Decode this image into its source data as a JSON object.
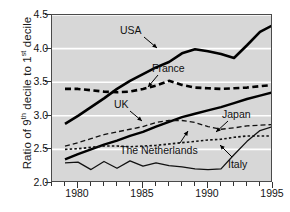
{
  "chart_data": {
    "type": "line",
    "title": "",
    "xlabel": "",
    "ylabel": "Ratio of 9th decile to 1st decile",
    "ylabel_parts": {
      "pre": "Ratio of 9",
      "sup1": "th",
      "mid": " decile to 1",
      "sup2": "st",
      "post": " decile"
    },
    "xlim": [
      1978,
      1995
    ],
    "ylim": [
      2.0,
      4.5
    ],
    "yticks": [
      2.0,
      2.5,
      3.0,
      3.5,
      4.0,
      4.5
    ],
    "ytick_labels": [
      "2.0",
      "2.5",
      "3.0",
      "3.5",
      "4.0",
      "4.5"
    ],
    "xticks": [
      1980,
      1985,
      1990,
      1995
    ],
    "xtick_labels": [
      "1980",
      "1985",
      "1990",
      "1995"
    ],
    "x_minor_ticks": [
      1978,
      1979,
      1980,
      1981,
      1982,
      1983,
      1984,
      1985,
      1986,
      1987,
      1988,
      1989,
      1990,
      1991,
      1992,
      1993,
      1994,
      1995
    ],
    "grid": "horizontal-white",
    "grid_color": "#ffffff",
    "plot_background": "#d7d7d7",
    "legend": "inline-annotations",
    "series": [
      {
        "name": "USA",
        "style": "thick-solid",
        "color": "#000000",
        "width": 2.6,
        "dash": "",
        "x": [
          1979,
          1980,
          1981,
          1982,
          1983,
          1984,
          1985,
          1986,
          1987,
          1988,
          1989,
          1990,
          1991,
          1992,
          1993,
          1994,
          1995
        ],
        "values": [
          2.88,
          3.0,
          3.13,
          3.26,
          3.4,
          3.52,
          3.62,
          3.72,
          3.8,
          3.93,
          3.99,
          3.96,
          3.92,
          3.86,
          4.05,
          4.25,
          4.35
        ]
      },
      {
        "name": "France",
        "style": "thick-dashed",
        "color": "#000000",
        "width": 2.6,
        "dash": "6,3.5",
        "x": [
          1979,
          1980,
          1981,
          1982,
          1983,
          1984,
          1985,
          1986,
          1987,
          1988,
          1989,
          1990,
          1991,
          1992,
          1993,
          1994,
          1995
        ],
        "values": [
          3.4,
          3.4,
          3.38,
          3.36,
          3.35,
          3.36,
          3.4,
          3.45,
          3.52,
          3.46,
          3.42,
          3.41,
          3.4,
          3.41,
          3.42,
          3.44,
          3.46
        ]
      },
      {
        "name": "UK",
        "style": "thick-solid",
        "color": "#000000",
        "width": 2.4,
        "dash": "",
        "x": [
          1979,
          1980,
          1981,
          1982,
          1983,
          1984,
          1985,
          1986,
          1987,
          1988,
          1989,
          1990,
          1991,
          1992,
          1993,
          1994,
          1995
        ],
        "values": [
          2.35,
          2.43,
          2.5,
          2.57,
          2.63,
          2.7,
          2.76,
          2.84,
          2.91,
          2.98,
          3.03,
          3.08,
          3.13,
          3.19,
          3.25,
          3.3,
          3.35
        ]
      },
      {
        "name": "Japan",
        "style": "thin-dashed",
        "color": "#111111",
        "width": 1.3,
        "dash": "5,3",
        "x": [
          1979,
          1980,
          1981,
          1982,
          1983,
          1984,
          1985,
          1986,
          1987,
          1988,
          1989,
          1990,
          1991,
          1992,
          1993,
          1994,
          1995
        ],
        "values": [
          2.55,
          2.6,
          2.66,
          2.72,
          2.76,
          2.8,
          2.84,
          2.9,
          2.93,
          2.93,
          2.9,
          2.84,
          2.8,
          2.82,
          2.85,
          2.86,
          2.87
        ]
      },
      {
        "name": "The Netherlands",
        "style": "thin-dotted",
        "color": "#111111",
        "width": 1.6,
        "dash": "2.5,2.2",
        "x": [
          1979,
          1980,
          1981,
          1982,
          1983,
          1984,
          1985,
          1986,
          1987,
          1988,
          1989,
          1990,
          1991,
          1992,
          1993,
          1994,
          1995
        ],
        "values": [
          2.5,
          2.51,
          2.53,
          2.55,
          2.55,
          2.54,
          2.55,
          2.56,
          2.58,
          2.6,
          2.62,
          2.64,
          2.65,
          2.68,
          2.7,
          2.7,
          2.7
        ]
      },
      {
        "name": "Italy",
        "style": "thin-solid",
        "color": "#111111",
        "width": 1.3,
        "dash": "",
        "x": [
          1979,
          1980,
          1981,
          1982,
          1983,
          1984,
          1985,
          1986,
          1987,
          1988,
          1989,
          1990,
          1991,
          1992,
          1993,
          1994,
          1995
        ],
        "values": [
          2.3,
          2.31,
          2.2,
          2.32,
          2.22,
          2.33,
          2.25,
          2.3,
          2.26,
          2.24,
          2.21,
          2.2,
          2.21,
          2.42,
          2.62,
          2.78,
          2.84
        ]
      }
    ],
    "annotations": [
      {
        "label": "USA",
        "lx": 68,
        "ly": 10,
        "ax": 92,
        "ay": 22,
        "tx": 105,
        "ty": 33
      },
      {
        "label": "France",
        "lx": 100,
        "ly": 48,
        "ax": 106,
        "ay": 60,
        "tx": 96,
        "ty": 72
      },
      {
        "label": "UK",
        "lx": 62,
        "ly": 84,
        "ax": 78,
        "ay": 96,
        "tx": 90,
        "ty": 106
      },
      {
        "label": "Japan",
        "lx": 170,
        "ly": 94,
        "ax": 176,
        "ay": 106,
        "tx": 164,
        "ty": 117
      },
      {
        "label": "The Netherlands",
        "lx": 68,
        "ly": 130,
        "ax": 128,
        "ay": 128,
        "tx": 136,
        "ty": 116
      },
      {
        "label": "Italy",
        "lx": 176,
        "ly": 144,
        "ax": 180,
        "ay": 142,
        "tx": 168,
        "ty": 130
      }
    ]
  }
}
